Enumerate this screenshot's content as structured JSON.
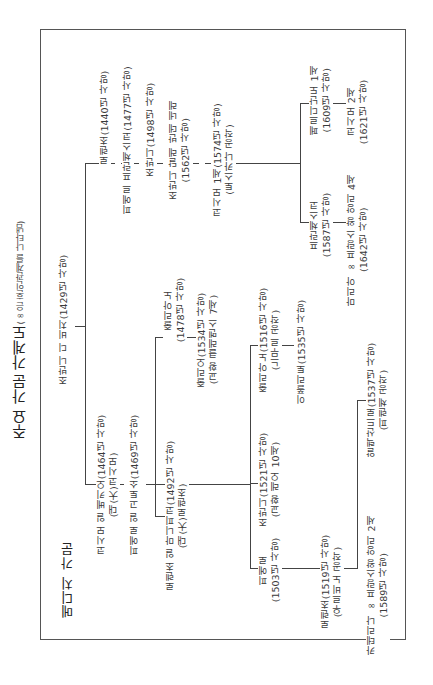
{
  "title": {
    "main": "주요 가문 가계도",
    "note": "(∞은 혼인관계를 나타냄)"
  },
  "family_label": "메디치 가문",
  "root": {
    "line1": "조반니 디 비치(1429년 사망)"
  },
  "upper_branch": {
    "lorenzo": {
      "line1": "로렌초(1440년 사망)"
    },
    "pierfrancesco": {
      "line1": "피에르 프란체스코(1477년 사망)"
    },
    "giovanni": {
      "line1": "조반니(1498년 사망)"
    },
    "giovanni_bande_nere": {
      "line1": "조반니 달레 반데 네레",
      "line2": "(1562년 사망)"
    },
    "cosimo1": {
      "line1": "코시모 1세(1574년 사망)",
      "line2": "(토스카나 공작)"
    },
    "ferdinando1": {
      "line1": "페르디난도 1세",
      "line2": "(1609년 사망)"
    },
    "cosimo2": {
      "line1": "코시모 2세",
      "line2": "(1621년 사망)"
    },
    "francesco": {
      "line1": "프란체스코",
      "line2": "(1587년 사망)"
    },
    "maria": {
      "line1": "마리아 ∞ 프랑스 왕 앙리 4세",
      "line2": "(1642년 사망)"
    }
  },
  "lower_branch": {
    "cosimo_vecchio": {
      "line1": "코시모 일 베키오(1464년 사망)",
      "line2": "(대(大)코시모)"
    },
    "piero_gottoso": {
      "line1": "피에로 일 고토소(1469년 사망)"
    },
    "giuliano_1478": {
      "line1": "줄리아노",
      "line2": "(1478년 사망)"
    },
    "giulio": {
      "line1": "줄리오(1534년 사망)",
      "line2": "(교황 클레멘스 7세)"
    },
    "lorenzo_magnifico": {
      "line1": "로렌초 일 마니피코(1492년 사망)",
      "line2": "(대(大)로렌초)"
    },
    "giuliano_1516": {
      "line1": "줄리아노(1516년 사망)",
      "line2": "(느무르 공작)"
    },
    "ippolito": {
      "line1": "이폴리토(1535년 사망)"
    },
    "giovanni_leo10": {
      "line1": "조반니(1521년 사망)",
      "line2": "(교황 레오 10세)"
    },
    "piero_1503": {
      "line1": "피에로",
      "line2": "(1503년 사망)"
    },
    "lorenzo_urbino": {
      "line1": "로렌초(1519년 사망)",
      "line2": "(우르비노 공작)"
    },
    "alessandro": {
      "line1": "알렉산드로(1537년 사망)",
      "line2": "(피렌체 공작)"
    },
    "caterina": {
      "line1": "카테리나 ∞ 프랑스왕 앙리 2세",
      "line2": "(1589년 사망)"
    }
  },
  "colors": {
    "line": "#444444",
    "text": "#3a3a3a",
    "frame": "#555555"
  }
}
